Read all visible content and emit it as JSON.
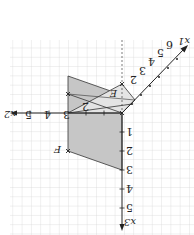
{
  "diagram": {
    "type": "3d-coordinate-sketch",
    "orientation": "rotated 180 degrees",
    "background": "#ffffff",
    "grid_color": "#cfcfcf",
    "shade_color": "#c8c8c8",
    "light_shade_color": "#e2e2e2",
    "line_color": "#333333",
    "axes": {
      "x1": {
        "label": "x1",
        "ticks": [
          "2",
          "3",
          "4",
          "5",
          "6"
        ]
      },
      "x2": {
        "label": "x2",
        "ticks": [
          "3",
          "4",
          "5"
        ]
      },
      "x3": {
        "label": "x3",
        "ticks": [
          "1",
          "2",
          "3",
          "4",
          "5"
        ]
      }
    },
    "points": {
      "E": "E",
      "F": "F"
    },
    "extra_labels": [
      "2"
    ]
  }
}
